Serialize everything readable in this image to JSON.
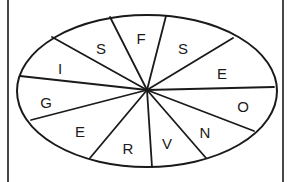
{
  "diagram": {
    "type": "letter-wheel",
    "shape": "ellipse",
    "center": [
      147,
      90
    ],
    "ellipse": {
      "cx": 147,
      "cy": 91,
      "rx": 130,
      "ry": 76
    },
    "frame": {
      "left": 8,
      "right": 283,
      "top": 0,
      "bottom": 182
    },
    "stroke_color": "#1a1a1a",
    "background": "#ffffff",
    "spokes": [
      [
        110,
        17
      ],
      [
        166,
        16
      ],
      [
        233,
        38
      ],
      [
        274,
        87
      ],
      [
        254,
        131
      ],
      [
        206,
        158
      ],
      [
        152,
        167
      ],
      [
        90,
        158
      ],
      [
        31,
        120
      ],
      [
        20,
        76
      ],
      [
        52,
        37
      ]
    ],
    "segments": [
      {
        "letter": "F",
        "x": 141,
        "y": 40
      },
      {
        "letter": "S",
        "x": 183,
        "y": 50
      },
      {
        "letter": "E",
        "x": 222,
        "y": 75
      },
      {
        "letter": "O",
        "x": 243,
        "y": 108
      },
      {
        "letter": "N",
        "x": 205,
        "y": 134
      },
      {
        "letter": "V",
        "x": 167,
        "y": 145
      },
      {
        "letter": "R",
        "x": 128,
        "y": 150
      },
      {
        "letter": "E",
        "x": 80,
        "y": 133
      },
      {
        "letter": "G",
        "x": 46,
        "y": 104
      },
      {
        "letter": "I",
        "x": 60,
        "y": 70
      },
      {
        "letter": "S",
        "x": 101,
        "y": 50
      }
    ]
  }
}
